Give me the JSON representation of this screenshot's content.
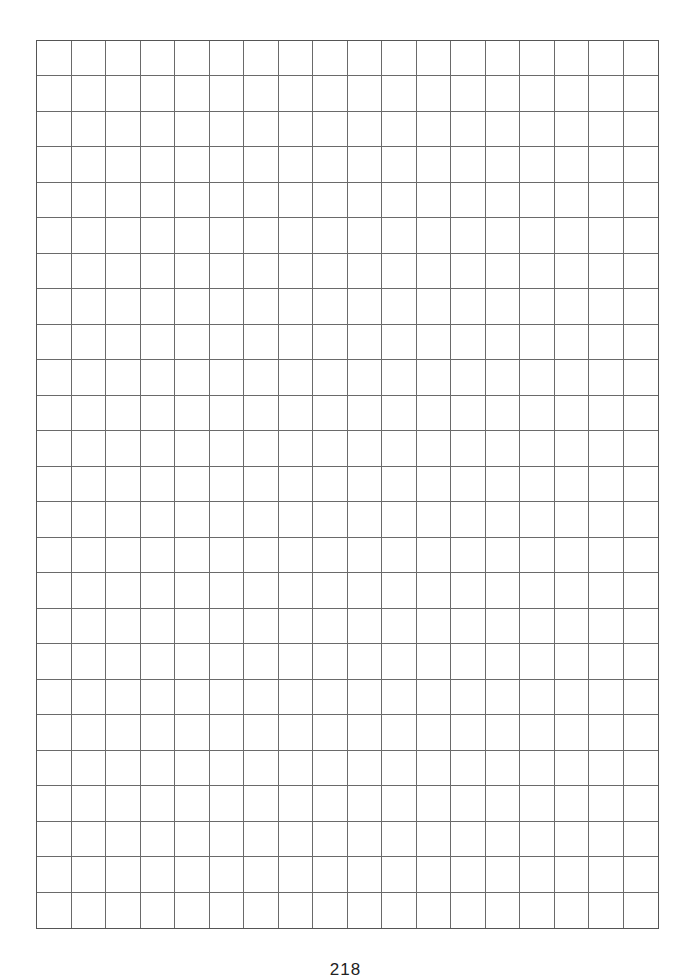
{
  "page": {
    "type": "graph-paper",
    "grid": {
      "columns": 18,
      "rows": 25,
      "line_color": "#6a6a6a",
      "border_color": "#555555"
    },
    "page_number": "218"
  }
}
